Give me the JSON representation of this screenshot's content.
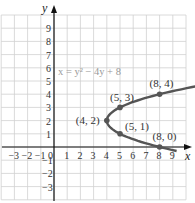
{
  "chart_data": {
    "type": "line",
    "title": "",
    "equation_label": "x = y² − 4y + 8",
    "xlabel": "x",
    "ylabel": "y",
    "xlim": [
      -4,
      10
    ],
    "ylim": [
      -4,
      10
    ],
    "grid": true,
    "x_ticks": [
      "−3",
      "−2",
      "−1",
      "0",
      "1",
      "2",
      "3",
      "4",
      "5",
      "6",
      "7",
      "8",
      "9"
    ],
    "y_ticks": [
      "9",
      "8",
      "7",
      "6",
      "5",
      "4",
      "3",
      "2",
      "1",
      "−1",
      "−2",
      "−3"
    ],
    "series": [
      {
        "name": "x = y^2 - 4y + 8",
        "curve": "parabola opening right, vertex (4, 2)",
        "y_range": [
          -0.3,
          4.8
        ]
      }
    ],
    "points": [
      {
        "x": 4,
        "y": 2,
        "label": "(4, 2)"
      },
      {
        "x": 5,
        "y": 3,
        "label": "(5, 3)"
      },
      {
        "x": 8,
        "y": 4,
        "label": "(8, 4)"
      },
      {
        "x": 5,
        "y": 1,
        "label": "(5, 1)"
      },
      {
        "x": 8,
        "y": 0,
        "label": "(8, 0)"
      }
    ],
    "colors": {
      "curve": "#555555",
      "grid": "#d0d0d0",
      "axis": "#111111",
      "equation": "#999999"
    }
  }
}
